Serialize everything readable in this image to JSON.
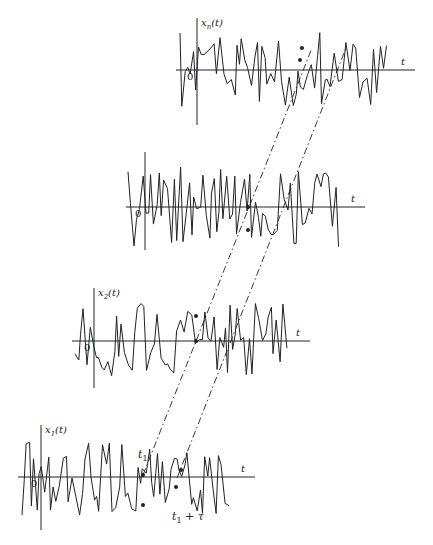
{
  "figure": {
    "note_on_waveforms": "Waveform shapes are procedurally generated placeholders that mimic the visual style of the noisy traces. They are NOT digitized from the source image; the original curve values could not be read point-by-point.",
    "width": 433,
    "height": 545
  },
  "panels": [
    {
      "id": "xn",
      "ylabel": "x",
      "ysub": "n",
      "yarg": "(t)",
      "xlabel": "t",
      "origin_label": "0",
      "approx_geometry_px": {
        "axis_y": 70,
        "axis_x_start": 176,
        "axis_x_end": 415,
        "origin_x": 197,
        "vaxis_top": 18,
        "vaxis_bottom": 125,
        "wave_x_start": 180,
        "wave_x_end": 388,
        "amplitude": 38
      },
      "waveform_source": "procedural-placeholder",
      "seed": 7
    },
    {
      "id": "x3",
      "ylabel": "",
      "ysub": "",
      "yarg": "",
      "xlabel": "t",
      "origin_label": "0",
      "approx_geometry_px": {
        "axis_y": 207,
        "axis_x_start": 126,
        "axis_x_end": 365,
        "origin_x": 145,
        "vaxis_top": 152,
        "vaxis_bottom": 250,
        "wave_x_start": 128,
        "wave_x_end": 340,
        "amplitude": 40
      },
      "waveform_source": "procedural-placeholder",
      "seed": 19
    },
    {
      "id": "x2",
      "ylabel": "x",
      "ysub": "2",
      "yarg": "(t)",
      "xlabel": "t",
      "origin_label": "0",
      "approx_geometry_px": {
        "axis_y": 341,
        "axis_x_start": 72,
        "axis_x_end": 310,
        "origin_x": 94,
        "vaxis_top": 288,
        "vaxis_bottom": 388,
        "wave_x_start": 75,
        "wave_x_end": 288,
        "amplitude": 38
      },
      "waveform_source": "procedural-placeholder",
      "seed": 31
    },
    {
      "id": "x1",
      "ylabel": "x",
      "ysub": "1",
      "yarg": "(t)",
      "xlabel": "t",
      "origin_label": "0",
      "approx_geometry_px": {
        "axis_y": 477,
        "axis_x_start": 18,
        "axis_x_end": 255,
        "origin_x": 41,
        "vaxis_top": 425,
        "vaxis_bottom": 530,
        "wave_x_start": 22,
        "wave_x_end": 232,
        "amplitude": 38
      },
      "waveform_source": "procedural-placeholder",
      "seed": 43
    }
  ],
  "annotations": {
    "t1_label": "t",
    "t1_sub": "1",
    "t1_tau_label": "t",
    "t1_tau_sub": "1",
    "t1_tau_suffix": " + τ",
    "t1_label_pos_px": [
      138,
      458
    ],
    "t1_tau_label_pos_px": [
      172,
      520
    ]
  },
  "dashed_lines": [
    {
      "name": "t1-line",
      "approx_from_px": [
        143,
        475
      ],
      "approx_to_px": [
        312,
        48
      ]
    },
    {
      "name": "t1-tau-line",
      "approx_from_px": [
        177,
        478
      ],
      "approx_to_px": [
        346,
        48
      ]
    }
  ],
  "sample_markers_px": [
    [
      143,
      475
    ],
    [
      143,
      505
    ],
    [
      176,
      487
    ],
    [
      181,
      470
    ],
    [
      196,
      341
    ],
    [
      196,
      316
    ],
    [
      248,
      207
    ],
    [
      248,
      230
    ],
    [
      300,
      60
    ],
    [
      302,
      48
    ]
  ],
  "colors": {
    "ink": "#222222",
    "background": "#ffffff"
  }
}
